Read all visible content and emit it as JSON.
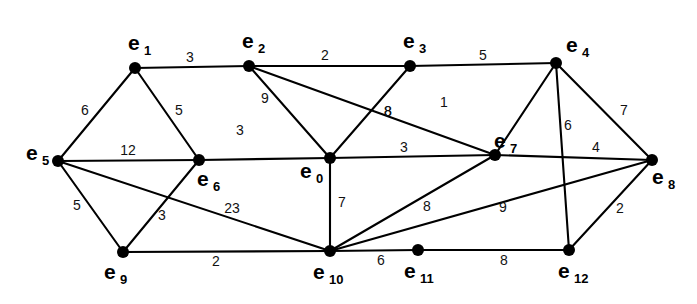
{
  "figure": {
    "kind": "weighted-undirected-graph",
    "background_color": "#ffffff",
    "stroke_color": "#000000",
    "width": 697,
    "height": 304
  },
  "chart_data": {
    "type": "diagram",
    "subtype": "weighted undirected graph (node-link diagram)",
    "title": "",
    "node_count": 13,
    "edge_count": 25,
    "nodes": [
      {
        "id": "e0",
        "base": "e",
        "sub": "0",
        "x": 330,
        "y": 158,
        "label_x": 300,
        "label_y": 178,
        "label_sub_x": 316,
        "label_sub_y": 183
      },
      {
        "id": "e1",
        "base": "e",
        "sub": "1",
        "x": 135,
        "y": 68,
        "label_x": 128,
        "label_y": 50,
        "label_sub_x": 144,
        "label_sub_y": 55
      },
      {
        "id": "e2",
        "base": "e",
        "sub": "2",
        "x": 249,
        "y": 66,
        "label_x": 242,
        "label_y": 48,
        "label_sub_x": 258,
        "label_sub_y": 53
      },
      {
        "id": "e3",
        "base": "e",
        "sub": "3",
        "x": 410,
        "y": 66,
        "label_x": 403,
        "label_y": 48,
        "label_sub_x": 419,
        "label_sub_y": 53
      },
      {
        "id": "e4",
        "base": "e",
        "sub": "4",
        "x": 556,
        "y": 63,
        "label_x": 566,
        "label_y": 52,
        "label_sub_x": 582,
        "label_sub_y": 57
      },
      {
        "id": "e5",
        "base": "e",
        "sub": "5",
        "x": 58,
        "y": 161,
        "label_x": 26,
        "label_y": 160,
        "label_sub_x": 42,
        "label_sub_y": 165
      },
      {
        "id": "e6",
        "base": "e",
        "sub": "6",
        "x": 199,
        "y": 160,
        "label_x": 197,
        "label_y": 186,
        "label_sub_x": 213,
        "label_sub_y": 191
      },
      {
        "id": "e7",
        "base": "e",
        "sub": "7",
        "x": 495,
        "y": 155,
        "label_x": 494,
        "label_y": 148,
        "label_sub_x": 510,
        "label_sub_y": 153
      },
      {
        "id": "e8",
        "base": "e",
        "sub": "8",
        "x": 652,
        "y": 160,
        "label_x": 652,
        "label_y": 184,
        "label_sub_x": 668,
        "label_sub_y": 189
      },
      {
        "id": "e9",
        "base": "e",
        "sub": "9",
        "x": 123,
        "y": 252,
        "label_x": 104,
        "label_y": 279,
        "label_sub_x": 120,
        "label_sub_y": 284
      },
      {
        "id": "e10",
        "base": "e",
        "sub": "10",
        "x": 330,
        "y": 251,
        "label_x": 313,
        "label_y": 279,
        "label_sub_x": 329,
        "label_sub_y": 284
      },
      {
        "id": "e11",
        "base": "e",
        "sub": "11",
        "x": 418,
        "y": 250,
        "label_x": 404,
        "label_y": 278,
        "label_sub_x": 420,
        "label_sub_y": 283
      },
      {
        "id": "e12",
        "base": "e",
        "sub": "12",
        "x": 569,
        "y": 250,
        "label_x": 558,
        "label_y": 278,
        "label_sub_x": 574,
        "label_sub_y": 283
      }
    ],
    "edges": [
      {
        "source": "e1",
        "target": "e2",
        "weight": 3,
        "label_x": 190,
        "label_y": 62
      },
      {
        "source": "e2",
        "target": "e3",
        "weight": 2,
        "label_x": 325,
        "label_y": 60
      },
      {
        "source": "e3",
        "target": "e4",
        "weight": 5,
        "label_x": 483,
        "label_y": 60
      },
      {
        "source": "e1",
        "target": "e5",
        "weight": 6,
        "label_x": 85,
        "label_y": 115
      },
      {
        "source": "e1",
        "target": "e6",
        "weight": 5,
        "label_x": 179,
        "label_y": 115
      },
      {
        "source": "e5",
        "target": "e6",
        "weight": 12,
        "label_x": 128,
        "label_y": 155
      },
      {
        "source": "e5",
        "target": "e9",
        "weight": 5,
        "label_x": 77,
        "label_y": 210
      },
      {
        "source": "e6",
        "target": "e9",
        "weight": 3,
        "label_x": 162,
        "label_y": 220
      },
      {
        "source": "e5",
        "target": "e10",
        "weight": 23,
        "label_x": 232,
        "label_y": 213
      },
      {
        "source": "e6",
        "target": "e0",
        "weight": 3,
        "label_x": 240,
        "label_y": 135
      },
      {
        "source": "e2",
        "target": "e0",
        "weight": 9,
        "label_x": 265,
        "label_y": 103
      },
      {
        "source": "e2",
        "target": "e7",
        "weight": 8,
        "label_x": 388,
        "label_y": 116
      },
      {
        "source": "e3",
        "target": "e0",
        "weight": 8,
        "label_x": 388,
        "label_y": 116
      },
      {
        "source": "e4",
        "target": "e7",
        "weight": 1,
        "label_x": 444,
        "label_y": 107
      },
      {
        "source": "e4",
        "target": "e8",
        "weight": 7,
        "label_x": 624,
        "label_y": 115
      },
      {
        "source": "e4",
        "target": "e12",
        "weight": 6,
        "label_x": 568,
        "label_y": 130
      },
      {
        "source": "e0",
        "target": "e7",
        "weight": 3,
        "label_x": 404,
        "label_y": 152
      },
      {
        "source": "e0",
        "target": "e10",
        "weight": 7,
        "label_x": 342,
        "label_y": 207
      },
      {
        "source": "e7",
        "target": "e8",
        "weight": 4,
        "label_x": 596,
        "label_y": 152
      },
      {
        "source": "e7",
        "target": "e10",
        "weight": 8,
        "label_x": 427,
        "label_y": 211
      },
      {
        "source": "e9",
        "target": "e10",
        "weight": 2,
        "label_x": 216,
        "label_y": 266
      },
      {
        "source": "e10",
        "target": "e11",
        "weight": 6,
        "label_x": 381,
        "label_y": 265
      },
      {
        "source": "e10",
        "target": "e8",
        "weight": 9,
        "label_x": 503,
        "label_y": 212
      },
      {
        "source": "e11",
        "target": "e12",
        "weight": 8,
        "label_x": 504,
        "label_y": 265
      },
      {
        "source": "e12",
        "target": "e8",
        "weight": 2,
        "label_x": 620,
        "label_y": 213
      }
    ]
  }
}
